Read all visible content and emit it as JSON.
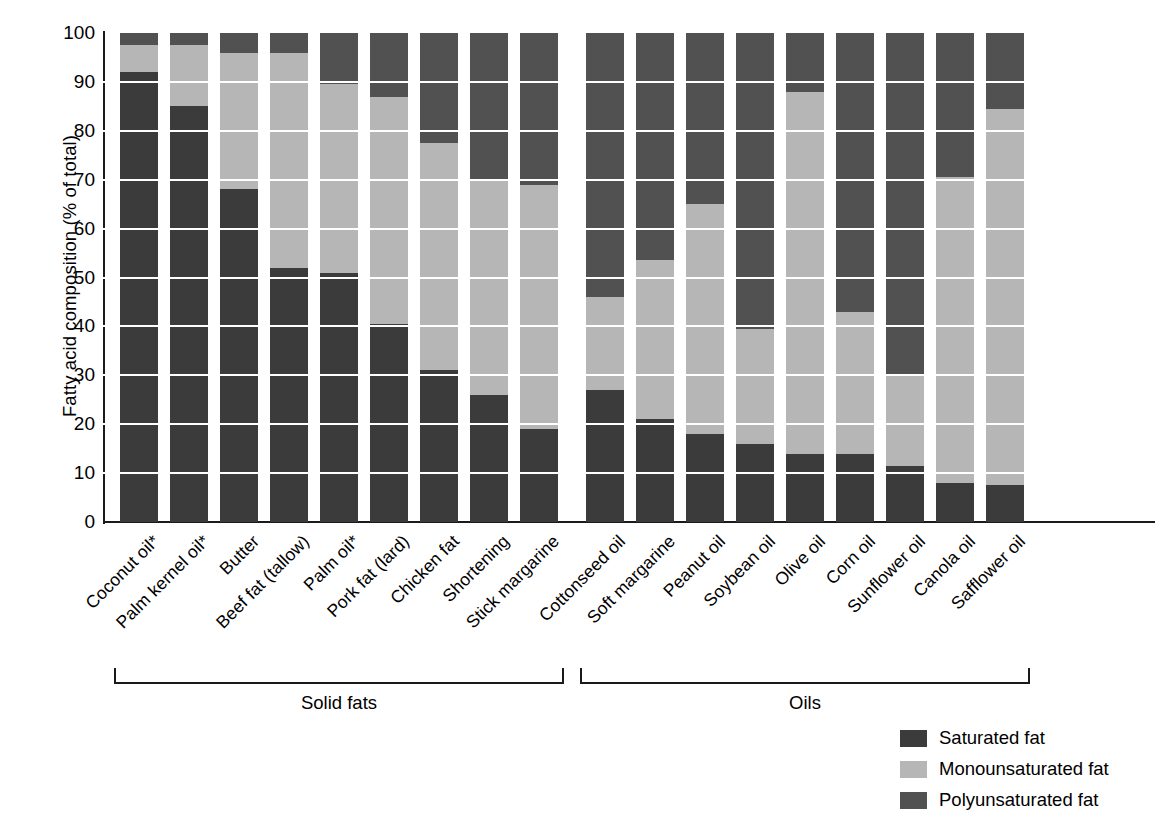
{
  "chart_data": {
    "type": "bar",
    "stacked": true,
    "title": "",
    "xlabel": "",
    "ylabel": "Fatty acid composition (% of total)",
    "ylim": [
      0,
      100
    ],
    "yticks": [
      0,
      10,
      20,
      30,
      40,
      50,
      60,
      70,
      80,
      90,
      100
    ],
    "grid": "horizontal-white-lines",
    "legend_position": "bottom-right",
    "categories": [
      "Coconut oil*",
      "Palm kernel oil*",
      "Butter",
      "Beef fat (tallow)",
      "Palm oil*",
      "Pork fat (lard)",
      "Chicken fat",
      "Shortening",
      "Stick margarine",
      "Cottonseed oil",
      "Soft margarine",
      "Peanut oil",
      "Soybean oil",
      "Olive oil",
      "Corn oil",
      "Sunflower oil",
      "Canola oil",
      "Safflower oil"
    ],
    "series": [
      {
        "name": "Saturated fat",
        "color": "#3b3b3b",
        "values": [
          92,
          85,
          68,
          52,
          51,
          40.5,
          31,
          26,
          19,
          27,
          21,
          18,
          16,
          14,
          14,
          11.5,
          8,
          7.5
        ]
      },
      {
        "name": "Monounsaturated fat",
        "color": "#b6b6b6",
        "values": [
          5.5,
          12.5,
          28,
          44,
          38.5,
          46.5,
          46.5,
          44,
          50,
          19,
          32.5,
          47,
          23.5,
          74,
          29,
          18.5,
          62.5,
          77
        ]
      },
      {
        "name": "Polyunsaturated fat",
        "color": "#515151",
        "values": [
          2.5,
          2.5,
          4,
          4,
          10.5,
          13,
          22.5,
          30,
          31,
          54,
          46.5,
          35,
          60.5,
          12,
          57,
          70,
          29.5,
          15.5
        ]
      }
    ],
    "cumulative_tops": [
      {
        "category": "Coconut oil*",
        "saturated_top": 92,
        "mono_top": 97.5
      },
      {
        "category": "Palm kernel oil*",
        "saturated_top": 85,
        "mono_top": 97.5
      },
      {
        "category": "Butter",
        "saturated_top": 68,
        "mono_top": 96
      },
      {
        "category": "Beef fat (tallow)",
        "saturated_top": 52,
        "mono_top": 96
      },
      {
        "category": "Palm oil*",
        "saturated_top": 51,
        "mono_top": 89.5
      },
      {
        "category": "Pork fat (lard)",
        "saturated_top": 40.5,
        "mono_top": 87
      },
      {
        "category": "Chicken fat",
        "saturated_top": 31,
        "mono_top": 77.5
      },
      {
        "category": "Shortening",
        "saturated_top": 26,
        "mono_top": 70
      },
      {
        "category": "Stick margarine",
        "saturated_top": 19,
        "mono_top": 69
      },
      {
        "category": "Cottonseed oil",
        "saturated_top": 27,
        "mono_top": 46
      },
      {
        "category": "Soft margarine",
        "saturated_top": 21,
        "mono_top": 53.5
      },
      {
        "category": "Peanut oil",
        "saturated_top": 18,
        "mono_top": 65
      },
      {
        "category": "Soybean oil",
        "saturated_top": 16,
        "mono_top": 39.5
      },
      {
        "category": "Olive oil",
        "saturated_top": 14,
        "mono_top": 88
      },
      {
        "category": "Corn oil",
        "saturated_top": 14,
        "mono_top": 43
      },
      {
        "category": "Sunflower oil",
        "saturated_top": 11.5,
        "mono_top": 30
      },
      {
        "category": "Canola oil",
        "saturated_top": 8,
        "mono_top": 70.5
      },
      {
        "category": "Safflower oil",
        "saturated_top": 7.5,
        "mono_top": 84.5
      }
    ],
    "groups": [
      {
        "label": "Solid fats",
        "start_index": 0,
        "end_index": 8
      },
      {
        "label": "Oils",
        "start_index": 9,
        "end_index": 17
      }
    ],
    "legend": [
      {
        "label": "Saturated fat",
        "color": "#3b3b3b"
      },
      {
        "label": "Monounsaturated fat",
        "color": "#b6b6b6"
      },
      {
        "label": "Polyunsaturated fat",
        "color": "#515151"
      }
    ]
  }
}
